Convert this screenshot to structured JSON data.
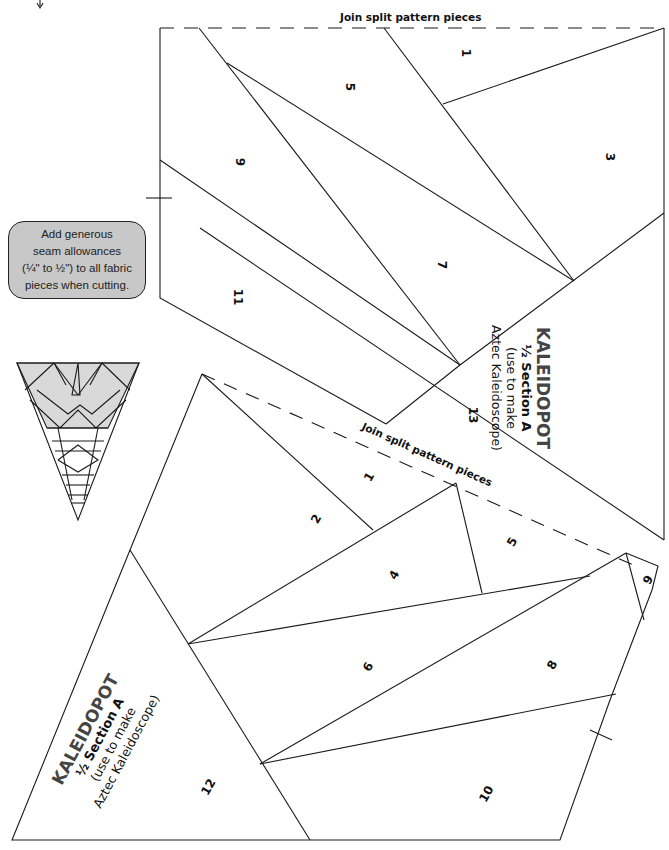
{
  "instructions": {
    "note_lines": [
      "Add generous",
      "seam allowances",
      "(¼\" to ½\") to all fabric",
      "pieces when cutting."
    ],
    "box_fill": "#c8c8c8"
  },
  "pattern_upper": {
    "join_label": "Join split pattern pieces",
    "piece_numbers": [
      "1",
      "3",
      "5",
      "7",
      "9",
      "11",
      "13"
    ],
    "title": {
      "line1": "KALEIDOPOT",
      "line2": "½ Section A",
      "line3": "(use to make",
      "line4": "Aztec Kaleidoscope)"
    }
  },
  "pattern_lower": {
    "join_label": "Join split pattern pieces",
    "piece_numbers": [
      "1",
      "2",
      "4",
      "5",
      "6",
      "8",
      "9",
      "10",
      "12"
    ],
    "title": {
      "line1": "KALEIDOPOT",
      "line2": "½ Section A",
      "line3": "(use to make",
      "line4": "Aztec Kaleidoscope)"
    }
  },
  "thumbnail": {
    "label": "aztec-kaleidoscope-block-preview",
    "fill_top": "#d9d9d9"
  },
  "colors": {
    "line": "#1a1a1a",
    "title_gray": "#444444"
  }
}
